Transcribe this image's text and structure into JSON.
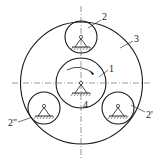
{
  "diagram": {
    "type": "planetary-gear-train",
    "labels": {
      "sun_gear": "1",
      "planet_top": "2",
      "ring_gear": "3",
      "frame": "4",
      "planet_right": "2'",
      "planet_left": "2\""
    },
    "colors": {
      "stroke": "#1a1a1a",
      "background": "#ffffff"
    }
  }
}
